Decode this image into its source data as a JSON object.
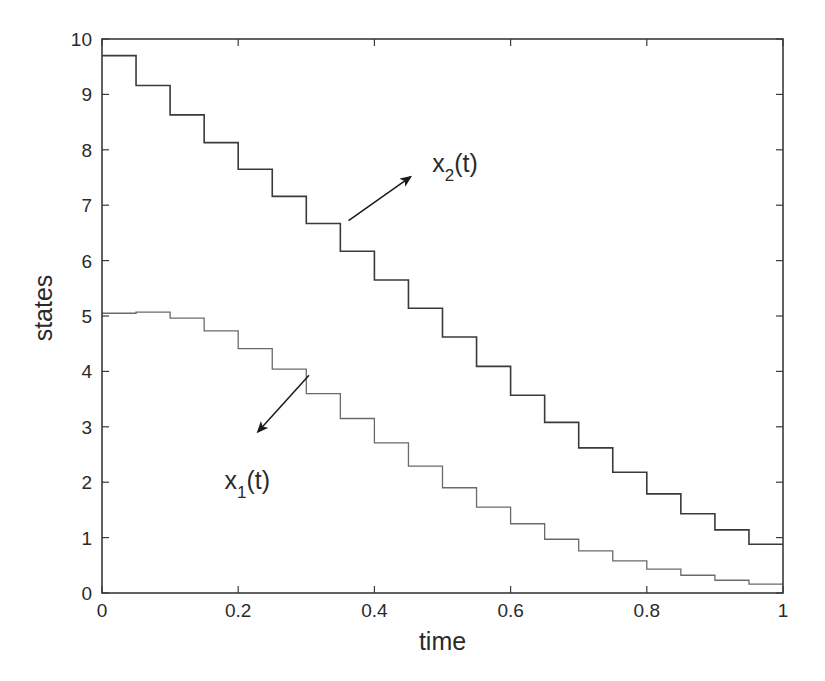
{
  "chart_data": {
    "type": "line",
    "subtype": "step",
    "title": "",
    "xlabel": "time",
    "ylabel": "states",
    "xlim": [
      0,
      1
    ],
    "ylim": [
      0,
      10
    ],
    "xticks": [
      0,
      0.2,
      0.4,
      0.6,
      0.8,
      1
    ],
    "xtick_labels": [
      "0",
      "0.2",
      "0.4",
      "0.6",
      "0.8",
      "1"
    ],
    "yticks": [
      0,
      1,
      2,
      3,
      4,
      5,
      6,
      7,
      8,
      9,
      10
    ],
    "ytick_labels": [
      "0",
      "1",
      "2",
      "3",
      "4",
      "5",
      "6",
      "7",
      "8",
      "9",
      "10"
    ],
    "grid": false,
    "legend": null,
    "x": [
      0,
      0.05,
      0.1,
      0.15,
      0.2,
      0.25,
      0.3,
      0.35,
      0.4,
      0.45,
      0.5,
      0.55,
      0.6,
      0.65,
      0.7,
      0.75,
      0.8,
      0.85,
      0.9,
      0.95,
      1.0
    ],
    "series": [
      {
        "name": "x2(t)",
        "color": "#3a3a3a",
        "values": [
          9.7,
          9.16,
          8.63,
          8.13,
          7.65,
          7.16,
          6.67,
          6.17,
          5.65,
          5.14,
          4.62,
          4.09,
          3.57,
          3.08,
          2.62,
          2.18,
          1.79,
          1.43,
          1.14,
          0.88,
          0.88
        ]
      },
      {
        "name": "x1(t)",
        "color": "#6a6a6a",
        "values": [
          5.05,
          5.07,
          4.96,
          4.73,
          4.41,
          4.04,
          3.6,
          3.15,
          2.71,
          2.29,
          1.9,
          1.55,
          1.25,
          0.97,
          0.76,
          0.58,
          0.43,
          0.32,
          0.23,
          0.16,
          0.16
        ]
      }
    ],
    "annotations": [
      {
        "text": "x",
        "subscript": "2",
        "suffix": "(t)",
        "series": "x2(t)",
        "arrow_from": [
          0.362,
          6.72
        ],
        "arrow_to": [
          0.453,
          7.51
        ],
        "label_at": [
          0.485,
          7.6
        ]
      },
      {
        "text": "x",
        "subscript": "1",
        "suffix": "(t)",
        "series": "x1(t)",
        "arrow_from": [
          0.304,
          3.93
        ],
        "arrow_to": [
          0.229,
          2.91
        ],
        "label_at": [
          0.18,
          1.88
        ]
      }
    ]
  }
}
